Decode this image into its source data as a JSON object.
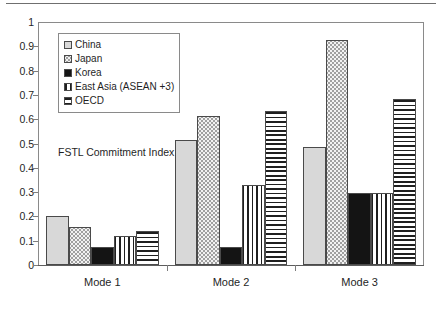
{
  "chart_data": {
    "type": "bar",
    "title": "",
    "subtitle": "",
    "annotation": "FSTL Commitment Index",
    "xlabel": "",
    "ylabel": "",
    "ylim": [
      0,
      1
    ],
    "ytick_labels": [
      "1",
      "0.9",
      "0.8",
      "0.7",
      "0.6",
      "0.5",
      "0.4",
      "0.3",
      "0.2",
      "0.1",
      "0"
    ],
    "ytick_values": [
      1,
      0.9,
      0.8,
      0.7,
      0.6,
      0.5,
      0.4,
      0.3,
      0.2,
      0.1,
      0
    ],
    "grid": false,
    "legend_position": "upper-left-inside",
    "categories": [
      "Mode 1",
      "Mode 2",
      "Mode 3"
    ],
    "series": [
      {
        "name": "China",
        "pattern": "solid-light-gray",
        "color": "#d8d8d8",
        "values": [
          0.2,
          0.515,
          0.485
        ]
      },
      {
        "name": "Japan",
        "pattern": "dotted-stipple",
        "color": "#f2f2f2",
        "values": [
          0.155,
          0.615,
          0.925
        ]
      },
      {
        "name": "Korea",
        "pattern": "solid-black",
        "color": "#141414",
        "values": [
          0.075,
          0.075,
          0.295
        ]
      },
      {
        "name": "East Asia (ASEAN +3)",
        "pattern": "vertical-stripes",
        "color": "#ffffff",
        "values": [
          0.12,
          0.33,
          0.295
        ]
      },
      {
        "name": "OECD",
        "pattern": "horizontal-stripes",
        "color": "#ffffff",
        "values": [
          0.14,
          0.635,
          0.685
        ]
      }
    ]
  },
  "legend": {
    "items": [
      {
        "label": "China"
      },
      {
        "label": "Japan"
      },
      {
        "label": "Korea"
      },
      {
        "label": "East Asia (ASEAN +3)"
      },
      {
        "label": "OECD"
      }
    ]
  },
  "axis": {
    "y_labels": [
      "1",
      "0.9",
      "0.8",
      "0.7",
      "0.6",
      "0.5",
      "0.4",
      "0.3",
      "0.2",
      "0.1",
      "0"
    ],
    "x_labels": [
      "Mode 1",
      "Mode 2",
      "Mode 3"
    ]
  },
  "annotation_text": "FSTL Commitment Index"
}
